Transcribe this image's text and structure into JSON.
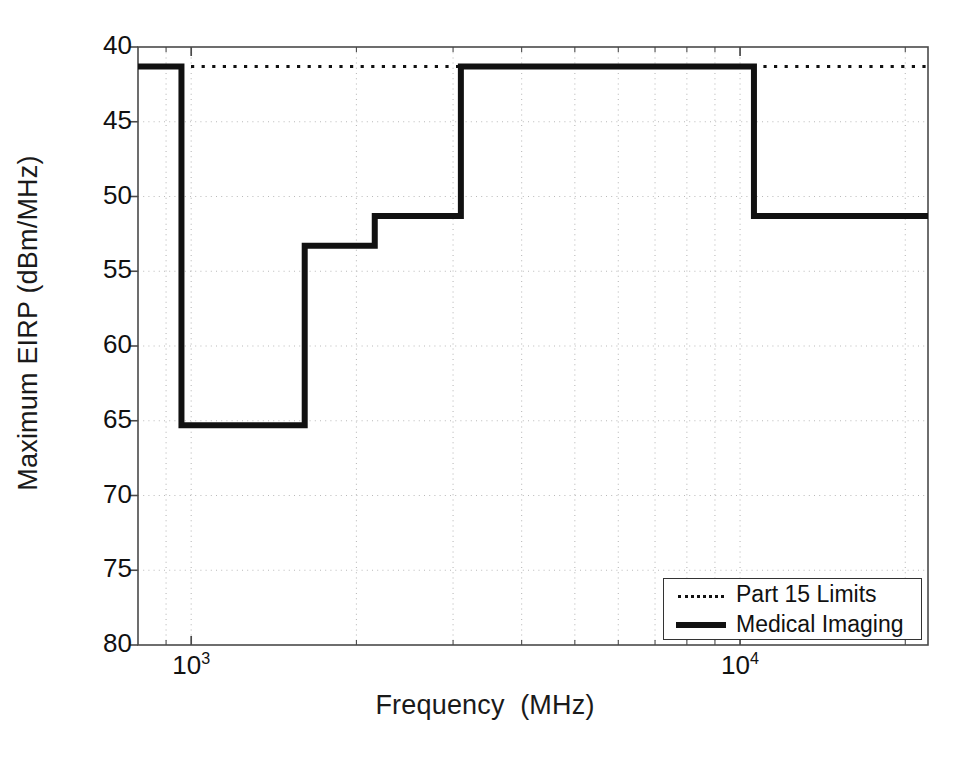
{
  "figure": {
    "background": "#ffffff",
    "foreground": "#111111"
  },
  "axes": {
    "xlabel": "Frequency  (MHz)",
    "ylabel": "Maximum EIRP (dBm/MHz)",
    "x_scale": "log",
    "y_scale": "linear",
    "y_inverted": true,
    "xlim": [
      800,
      22000
    ],
    "ylim": [
      40,
      80
    ],
    "x_major_ticks": [
      {
        "value": 1000,
        "mantissa": "10",
        "exponent": "3"
      },
      {
        "value": 10000,
        "mantissa": "10",
        "exponent": "4"
      }
    ],
    "y_ticks": [
      "40",
      "45",
      "50",
      "55",
      "60",
      "65",
      "70",
      "75",
      "80"
    ],
    "y_tick_values": [
      40,
      45,
      50,
      55,
      60,
      65,
      70,
      75,
      80
    ],
    "grid": "dotted-both"
  },
  "legend": {
    "position": "lower-right",
    "entries": [
      {
        "label": "Part 15 Limits",
        "style": "dotted",
        "color": "#111111"
      },
      {
        "label": "Medical Imaging",
        "style": "solid",
        "color": "#111111"
      }
    ]
  },
  "chart_data": {
    "type": "line",
    "title": "",
    "xlabel": "Frequency  (MHz)",
    "ylabel": "Maximum EIRP (dBm/MHz)",
    "xscale": "log",
    "xlim": [
      800,
      22000
    ],
    "ylim": [
      80,
      40
    ],
    "y_axis_inverted": true,
    "grid": true,
    "legend_position": "lower right",
    "series": [
      {
        "name": "Part 15 Limits",
        "style": "dotted",
        "color": "#111111",
        "line_width": 3,
        "step_type": "post",
        "points": [
          {
            "x": 800,
            "y": 41.3
          },
          {
            "x": 22000,
            "y": 41.3
          }
        ]
      },
      {
        "name": "Medical Imaging",
        "style": "solid",
        "color": "#111111",
        "line_width": 6,
        "step_type": "post",
        "points": [
          {
            "x": 800,
            "y": 41.3
          },
          {
            "x": 960,
            "y": 41.3
          },
          {
            "x": 960,
            "y": 65.3
          },
          {
            "x": 1610,
            "y": 65.3
          },
          {
            "x": 1610,
            "y": 53.3
          },
          {
            "x": 2160,
            "y": 53.3
          },
          {
            "x": 2160,
            "y": 51.3
          },
          {
            "x": 3100,
            "y": 51.3
          },
          {
            "x": 3100,
            "y": 41.3
          },
          {
            "x": 10600,
            "y": 41.3
          },
          {
            "x": 10600,
            "y": 51.3
          },
          {
            "x": 22000,
            "y": 51.3
          }
        ]
      }
    ]
  }
}
